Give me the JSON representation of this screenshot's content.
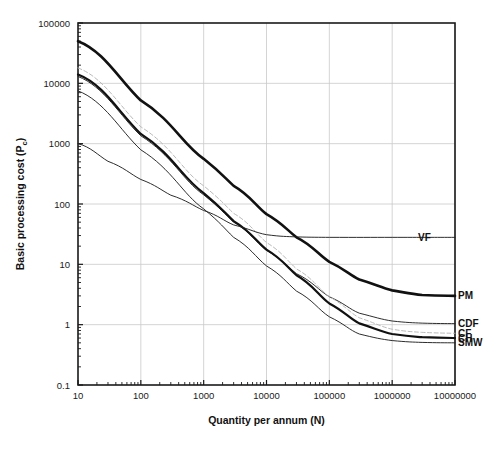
{
  "chart_data": {
    "type": "line",
    "title": "",
    "xlabel": "Quantity per annum (N)",
    "ylabel": "Basic processing cost (P",
    "ylabel_sub": "c",
    "ylabel_tail": ")",
    "xscale": "log",
    "yscale": "log",
    "xlim": [
      10,
      10000000
    ],
    "ylim": [
      0.1,
      100000
    ],
    "grid": true,
    "legend_position": "right-inline-labels",
    "xticks": [
      10,
      100,
      1000,
      10000,
      100000,
      1000000,
      10000000
    ],
    "xtick_labels": [
      "10",
      "100",
      "1000",
      "10000",
      "100000",
      "1000000",
      "10000000"
    ],
    "yticks": [
      0.1,
      1,
      10,
      100,
      1000,
      10000,
      100000
    ],
    "ytick_labels": [
      "0.1",
      "1",
      "10",
      "100",
      "1000",
      "10000",
      "100000"
    ],
    "series": [
      {
        "name": "PM",
        "label": "PM",
        "style": "solid-thick",
        "color": "#111111",
        "width": 2.6,
        "asymptote": 3.0,
        "points": [
          [
            10,
            50000
          ],
          [
            100,
            5200
          ],
          [
            1000,
            560
          ],
          [
            3000,
            200
          ],
          [
            10000,
            68
          ],
          [
            30000,
            28
          ],
          [
            100000,
            11
          ],
          [
            300000,
            5.6
          ],
          [
            1000000,
            3.7
          ],
          [
            3000000,
            3.1
          ],
          [
            10000000,
            3.0
          ]
        ]
      },
      {
        "name": "CDF",
        "label": "CDF",
        "style": "solid-thin",
        "color": "#222222",
        "width": 0.95,
        "asymptote": 1.05,
        "points": [
          [
            10,
            13000
          ],
          [
            100,
            1350
          ],
          [
            1000,
            142
          ],
          [
            3000,
            50
          ],
          [
            10000,
            17.0
          ],
          [
            30000,
            7.0
          ],
          [
            100000,
            2.9
          ],
          [
            300000,
            1.55
          ],
          [
            1000000,
            1.15
          ],
          [
            3000000,
            1.06
          ],
          [
            10000000,
            1.04
          ]
        ]
      },
      {
        "name": "CF",
        "label": "CF",
        "style": "dashed-light",
        "color": "#b5b5b5",
        "width": 0.95,
        "asymptote": 0.72,
        "points": [
          [
            10,
            18000
          ],
          [
            100,
            1900
          ],
          [
            1000,
            200
          ],
          [
            3000,
            70
          ],
          [
            10000,
            23
          ],
          [
            30000,
            8.4
          ],
          [
            100000,
            2.9
          ],
          [
            300000,
            1.3
          ],
          [
            1000000,
            0.84
          ],
          [
            3000000,
            0.745
          ],
          [
            10000000,
            0.72
          ]
        ]
      },
      {
        "name": "CH",
        "label": "CH",
        "style": "solid-thick",
        "color": "#111111",
        "width": 2.2,
        "asymptote": 0.6,
        "points": [
          [
            10,
            14000
          ],
          [
            100,
            1450
          ],
          [
            1000,
            152
          ],
          [
            3000,
            52
          ],
          [
            10000,
            17.5
          ],
          [
            30000,
            6.6
          ],
          [
            100000,
            2.25
          ],
          [
            300000,
            1.05
          ],
          [
            1000000,
            0.7
          ],
          [
            3000000,
            0.62
          ],
          [
            10000000,
            0.6
          ]
        ]
      },
      {
        "name": "SMW",
        "label": "SMW",
        "style": "solid-thin",
        "color": "#222222",
        "width": 0.95,
        "asymptote": 0.5,
        "points": [
          [
            10,
            7500
          ],
          [
            100,
            790
          ],
          [
            1000,
            83
          ],
          [
            3000,
            28
          ],
          [
            10000,
            9.4
          ],
          [
            30000,
            3.6
          ],
          [
            100000,
            1.35
          ],
          [
            300000,
            0.7
          ],
          [
            1000000,
            0.545
          ],
          [
            3000000,
            0.508
          ],
          [
            10000000,
            0.5
          ]
        ]
      },
      {
        "name": "VF",
        "label": "VF",
        "style": "solid-thin",
        "color": "#222222",
        "width": 0.95,
        "asymptote": 28,
        "points": [
          [
            10,
            1000
          ],
          [
            30,
            510
          ],
          [
            100,
            255
          ],
          [
            300,
            140
          ],
          [
            1000,
            78
          ],
          [
            3000,
            45
          ],
          [
            10000,
            31
          ],
          [
            30000,
            28.5
          ],
          [
            100000,
            28
          ],
          [
            1000000,
            28
          ],
          [
            10000000,
            28
          ]
        ]
      }
    ],
    "annotations": [
      {
        "text": "VF",
        "x": 1000000,
        "y": 28
      },
      {
        "text": "PM",
        "x": 10000000,
        "y": 3.0
      },
      {
        "text": "CDF",
        "x": 10000000,
        "y": 1.05
      },
      {
        "text": "CF",
        "x": 10000000,
        "y": 0.72
      },
      {
        "text": "CH",
        "x": 10000000,
        "y": 0.6
      },
      {
        "text": "SMW",
        "x": 10000000,
        "y": 0.5
      }
    ]
  },
  "axis": {
    "x_title": "Quantity per annum (N)",
    "y_title_main": "Basic processing cost (P",
    "y_title_sub": "c",
    "y_title_tail": ")"
  },
  "labels": {
    "vf": "VF",
    "pm": "PM",
    "cdf": "CDF",
    "cf": "CF",
    "ch": "CH",
    "smw": "SMW"
  },
  "xtick": {
    "t0": "10",
    "t1": "100",
    "t2": "1000",
    "t3": "10000",
    "t4": "100000",
    "t5": "1000000",
    "t6": "10000000"
  },
  "ytick": {
    "t0": "0.1",
    "t1": "1",
    "t2": "10",
    "t3": "100",
    "t4": "1000",
    "t5": "10000",
    "t6": "100000"
  },
  "colors": {
    "axis": "#1a1a1a",
    "grid": "#c9c9c9",
    "curve_dark": "#111111",
    "curve_light": "#b5b5b5",
    "background": "#ffffff"
  }
}
